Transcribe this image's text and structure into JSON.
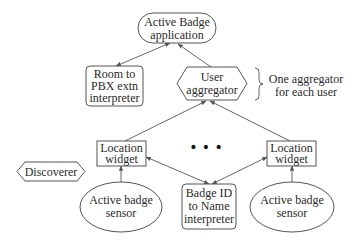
{
  "diagram": {
    "nodes": {
      "app": {
        "lines": [
          "Active Badge",
          "application"
        ],
        "shape": "pill"
      },
      "room_pbx": {
        "lines": [
          "Room to",
          "PBX extn",
          "interpreter"
        ],
        "shape": "rounded-rect"
      },
      "user_agg": {
        "lines": [
          "User",
          "aggregator"
        ],
        "shape": "hexagon"
      },
      "loc_left": {
        "lines": [
          "Location",
          "widget"
        ],
        "shape": "rect"
      },
      "loc_right": {
        "lines": [
          "Location",
          "widget"
        ],
        "shape": "rect"
      },
      "discoverer": {
        "lines": [
          "Discoverer"
        ],
        "shape": "hexagon"
      },
      "badge_name": {
        "lines": [
          "Badge ID",
          "to Name",
          "interpreter"
        ],
        "shape": "rounded-rect"
      },
      "sensor_left": {
        "lines": [
          "Active badge",
          "sensor"
        ],
        "shape": "ellipse"
      },
      "sensor_right": {
        "lines": [
          "Active badge",
          "sensor"
        ],
        "shape": "ellipse"
      }
    },
    "annotation": {
      "lines": [
        "One aggregator",
        "for each user"
      ]
    },
    "ellipsis": "• • •",
    "edges": [
      {
        "from": "app",
        "to": "room_pbx",
        "arrow": "both"
      },
      {
        "from": "user_agg",
        "to": "app",
        "arrow": "end"
      },
      {
        "from": "loc_left",
        "to": "user_agg",
        "arrow": "end"
      },
      {
        "from": "loc_right",
        "to": "user_agg",
        "arrow": "end"
      },
      {
        "from": "sensor_left",
        "to": "loc_left",
        "arrow": "end"
      },
      {
        "from": "sensor_right",
        "to": "loc_right",
        "arrow": "end"
      },
      {
        "from": "loc_left",
        "to": "badge_name",
        "arrow": "both"
      },
      {
        "from": "loc_right",
        "to": "badge_name",
        "arrow": "both"
      }
    ]
  }
}
